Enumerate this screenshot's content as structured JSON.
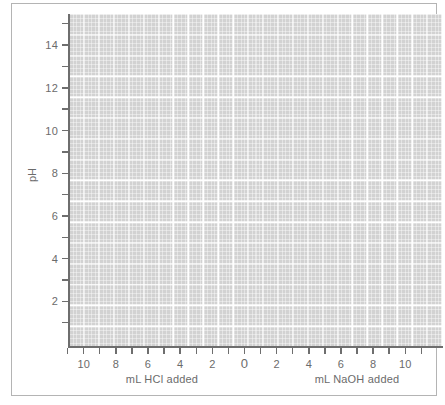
{
  "chart_data": {
    "type": "line",
    "title": "",
    "subtitle": "",
    "ylabel": "pH",
    "xlabel_left": "mL HCl added",
    "xlabel_right": "mL NaOH added",
    "ylim": [
      0,
      15.6
    ],
    "xlim": [
      -11.6,
      11.6
    ],
    "grid": true,
    "legend": null,
    "series": [],
    "values": [],
    "x": [],
    "y_major_ticks": [
      2,
      4,
      6,
      8,
      10,
      12,
      14
    ],
    "y_minor_ticks": [
      1,
      3,
      5,
      7,
      9,
      11,
      13,
      15
    ],
    "y_tick_labels": [
      "2",
      "4",
      "6",
      "8",
      "10",
      "12",
      "14"
    ],
    "x_major_ticks": [
      -10,
      -8,
      -6,
      -4,
      -2,
      0,
      2,
      4,
      6,
      8,
      10
    ],
    "x_minor_ticks": [
      -11,
      -9,
      -7,
      -5,
      -3,
      -1,
      1,
      3,
      5,
      7,
      9,
      11
    ],
    "x_tick_labels": [
      "10",
      "8",
      "6",
      "4",
      "2",
      "0",
      "2",
      "4",
      "6",
      "8",
      "10"
    ],
    "plot_background_color": "#d2d2d2",
    "gridline_color": "#ffffff",
    "axis_color": "#6e6e6e",
    "text_color": "#6b6b6b",
    "frame_color": "#b4b4b4"
  },
  "axes": {
    "y": {
      "title": "pH",
      "ticks": [
        {
          "label": "2",
          "value": 2,
          "major": true
        },
        {
          "label": "4",
          "value": 4,
          "major": true
        },
        {
          "label": "6",
          "value": 6,
          "major": true
        },
        {
          "label": "8",
          "value": 8,
          "major": true
        },
        {
          "label": "10",
          "value": 10,
          "major": true
        },
        {
          "label": "12",
          "value": 12,
          "major": true
        },
        {
          "label": "14",
          "value": 14,
          "major": true
        },
        {
          "label": "",
          "value": 1,
          "major": false
        },
        {
          "label": "",
          "value": 3,
          "major": false
        },
        {
          "label": "",
          "value": 5,
          "major": false
        },
        {
          "label": "",
          "value": 7,
          "major": false
        },
        {
          "label": "",
          "value": 9,
          "major": false
        },
        {
          "label": "",
          "value": 11,
          "major": false
        },
        {
          "label": "",
          "value": 13,
          "major": false
        },
        {
          "label": "",
          "value": 15,
          "major": false
        }
      ]
    },
    "x": {
      "title_left": "mL HCl added",
      "title_right": "mL NaOH added",
      "ticks": [
        {
          "label": "",
          "value": -11,
          "major": false
        },
        {
          "label": "10",
          "value": -10,
          "major": true
        },
        {
          "label": "",
          "value": -9,
          "major": false
        },
        {
          "label": "8",
          "value": -8,
          "major": true
        },
        {
          "label": "",
          "value": -7,
          "major": false
        },
        {
          "label": "6",
          "value": -6,
          "major": true
        },
        {
          "label": "",
          "value": -5,
          "major": false
        },
        {
          "label": "4",
          "value": -4,
          "major": true
        },
        {
          "label": "",
          "value": -3,
          "major": false
        },
        {
          "label": "2",
          "value": -2,
          "major": true
        },
        {
          "label": "",
          "value": -1,
          "major": false
        },
        {
          "label": "0",
          "value": 0,
          "major": true
        },
        {
          "label": "",
          "value": 1,
          "major": false
        },
        {
          "label": "2",
          "value": 2,
          "major": true
        },
        {
          "label": "",
          "value": 3,
          "major": false
        },
        {
          "label": "4",
          "value": 4,
          "major": true
        },
        {
          "label": "",
          "value": 5,
          "major": false
        },
        {
          "label": "6",
          "value": 6,
          "major": true
        },
        {
          "label": "",
          "value": 7,
          "major": false
        },
        {
          "label": "8",
          "value": 8,
          "major": true
        },
        {
          "label": "",
          "value": 9,
          "major": false
        },
        {
          "label": "10",
          "value": 10,
          "major": true
        },
        {
          "label": "",
          "value": 11,
          "major": false
        }
      ]
    }
  }
}
